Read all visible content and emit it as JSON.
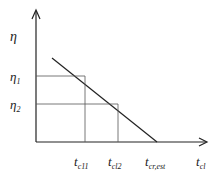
{
  "diagram": {
    "y_axis_label": "η",
    "x_axis_label": {
      "base": "t",
      "sub": "cl"
    },
    "y_ticks": [
      {
        "base": "η",
        "sub": "1"
      },
      {
        "base": "η",
        "sub": "2"
      }
    ],
    "x_ticks": [
      {
        "base": "t",
        "sub": "c11"
      },
      {
        "base": "t",
        "sub": "cl2"
      },
      {
        "base": "t",
        "sub": "cr,est"
      }
    ],
    "colors": {
      "line": "#222222",
      "guide": "#555555"
    }
  }
}
